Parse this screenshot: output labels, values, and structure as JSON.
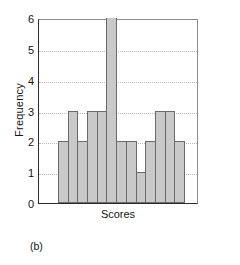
{
  "figure": {
    "caption": "(b)"
  },
  "chart_data": {
    "type": "bar",
    "title": "",
    "subtitle": "",
    "xlabel": "Scores",
    "ylabel": "Frequency",
    "categories": [
      "1",
      "2",
      "3",
      "4",
      "5",
      "6",
      "7",
      "8",
      "9",
      "10",
      "11",
      "12",
      "13"
    ],
    "values": [
      2,
      3,
      2,
      3,
      3,
      6,
      2,
      2,
      1,
      2,
      3,
      3,
      2
    ],
    "series": [
      {
        "name": "Frequency",
        "values": [
          2,
          3,
          2,
          3,
          3,
          6,
          2,
          2,
          1,
          2,
          3,
          3,
          2
        ]
      }
    ],
    "ylim": [
      0,
      6
    ],
    "xlim": [
      0,
      13
    ],
    "ytick_labels": [
      "0",
      "1",
      "2",
      "3",
      "4",
      "5",
      "6"
    ],
    "ytick_values": [
      0,
      1,
      2,
      3,
      4,
      5,
      6
    ],
    "xtick_labels": [],
    "grid": "horizontal-dotted",
    "legend": "none",
    "bar_fill_color": "#c9c9c9",
    "bar_edge_color": "#6a6a6a",
    "axis_color": "#2b2b2b",
    "gridline_color": "#b9b9b9",
    "background_color": "#ffffff",
    "annotations": []
  }
}
